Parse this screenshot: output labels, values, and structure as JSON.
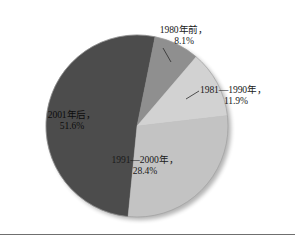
{
  "chart_data": {
    "type": "pie",
    "title": "",
    "categories": [
      "1980年前",
      "1981—1990年",
      "1991—2000年",
      "2001年后"
    ],
    "values": [
      8.1,
      11.9,
      28.4,
      51.6
    ],
    "value_unit": "%",
    "colors": [
      "#8f8f8f",
      "#d2d2d2",
      "#c3c3c3",
      "#4c4c4c"
    ],
    "legend": "none",
    "slices": [
      {
        "name": "1980年前",
        "label_line1": "1980年前，",
        "label_line2": "8.1%",
        "value": 8.1,
        "color": "#8f8f8f",
        "label_position": "outside-top"
      },
      {
        "name": "1981—1990年",
        "label_line1": "1981—1990年，",
        "label_line2": "11.9%",
        "value": 11.9,
        "color": "#d2d2d2",
        "label_position": "outside-right"
      },
      {
        "name": "1991—2000年",
        "label_line1": "1991—2000年，",
        "label_line2": "28.4%",
        "value": 28.4,
        "color": "#c3c3c3",
        "label_position": "inside-bottom"
      },
      {
        "name": "2001年后",
        "label_line1": "2001年后，",
        "label_line2": "51.6%",
        "value": 51.6,
        "color": "#4c4c4c",
        "label_position": "inside-left"
      }
    ]
  }
}
